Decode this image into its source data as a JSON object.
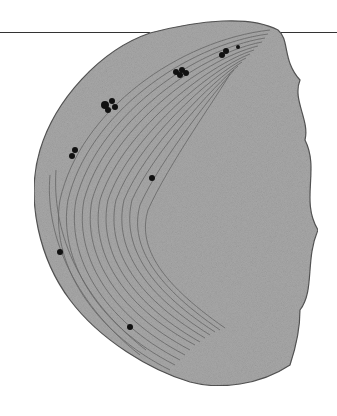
{
  "figure": {
    "colors": {
      "background": "#ffffff",
      "stroma": "#a8a8a8",
      "membrane": "#555555",
      "granule": "#111111",
      "rule": "#333333"
    },
    "granules": [
      [
        105,
        105,
        4
      ],
      [
        112,
        101,
        3
      ],
      [
        108,
        110,
        3
      ],
      [
        115,
        107,
        3
      ],
      [
        176,
        72,
        3
      ],
      [
        182,
        70,
        3
      ],
      [
        186,
        73,
        3
      ],
      [
        180,
        75,
        3
      ],
      [
        222,
        55,
        3
      ],
      [
        226,
        51,
        3
      ],
      [
        75,
        150,
        3
      ],
      [
        72,
        156,
        3
      ],
      [
        152,
        178,
        3
      ],
      [
        60,
        252,
        3
      ],
      [
        130,
        327,
        3
      ],
      [
        238,
        47,
        2
      ]
    ]
  }
}
